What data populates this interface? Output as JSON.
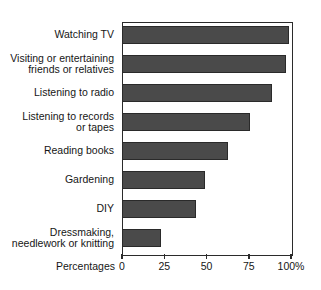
{
  "chart_data": {
    "type": "bar",
    "orientation": "horizontal",
    "title": "",
    "xlabel": "Percentages",
    "ylabel": "",
    "xlim": [
      0,
      100
    ],
    "grid": false,
    "legend": null,
    "bar_color": "#4a4a4a",
    "axis_color": "#2b2b2b",
    "categories": [
      "Watching TV",
      "Visiting or entertaining friends or relatives",
      "Listening to radio",
      "Listening to records or tapes",
      "Reading books",
      "Gardening",
      "DIY",
      "Dressmaking, needlework or knitting"
    ],
    "category_lines": [
      [
        "Watching TV"
      ],
      [
        "Visiting or entertaining",
        "friends or relatives"
      ],
      [
        "Listening to radio"
      ],
      [
        "Listening to records",
        "or tapes"
      ],
      [
        "Reading books"
      ],
      [
        "Gardening"
      ],
      [
        "DIY"
      ],
      [
        "Dressmaking,",
        "needlework or knitting"
      ]
    ],
    "values": [
      99,
      97,
      89,
      76,
      63,
      49,
      44,
      23
    ],
    "xticks": [
      0,
      25,
      50,
      75,
      100
    ],
    "xtick_labels": [
      "0",
      "25",
      "50",
      "75",
      "100%"
    ]
  }
}
